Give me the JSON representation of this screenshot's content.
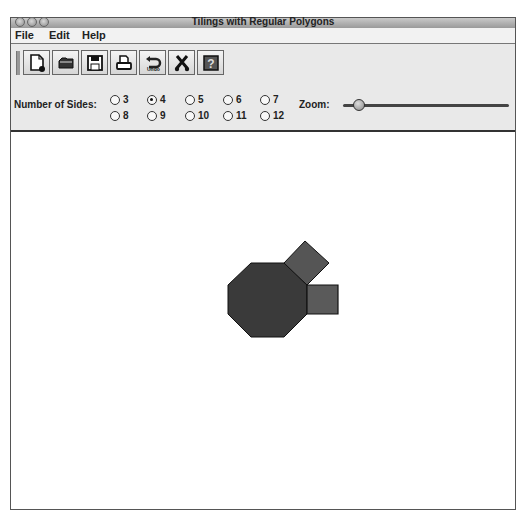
{
  "window": {
    "title": "Tilings with Regular Polygons"
  },
  "menubar": {
    "items": [
      "File",
      "Edit",
      "Help"
    ]
  },
  "toolbar": {
    "buttons": [
      {
        "name": "new",
        "icon": "new-document-icon"
      },
      {
        "name": "open",
        "icon": "folder-open-icon"
      },
      {
        "name": "save",
        "icon": "floppy-disk-icon"
      },
      {
        "name": "print",
        "icon": "printer-icon"
      },
      {
        "name": "undo",
        "icon": "undo-arrow-icon",
        "label": "Undo"
      },
      {
        "name": "clear",
        "icon": "scissors-icon"
      },
      {
        "name": "help",
        "icon": "help-question-icon"
      }
    ]
  },
  "controls": {
    "sides_label": "Number of Sides:",
    "sides_options": [
      "3",
      "4",
      "5",
      "6",
      "7",
      "8",
      "9",
      "10",
      "11",
      "12"
    ],
    "selected_sides": "4",
    "zoom_label": "Zoom:",
    "zoom_position_pct": 10
  },
  "canvas": {
    "shapes": [
      {
        "type": "octagon",
        "fill": "#3a3a3a",
        "points": "250,262 283,262 306,284 306,313 283,336 250,336 227,313 227,284"
      },
      {
        "type": "square",
        "fill": "#555555",
        "points": "283,262 304,240 328,262 306,284"
      },
      {
        "type": "square",
        "fill": "#5a5a5a",
        "points": "306,284 337,284 337,313 306,313"
      }
    ]
  }
}
